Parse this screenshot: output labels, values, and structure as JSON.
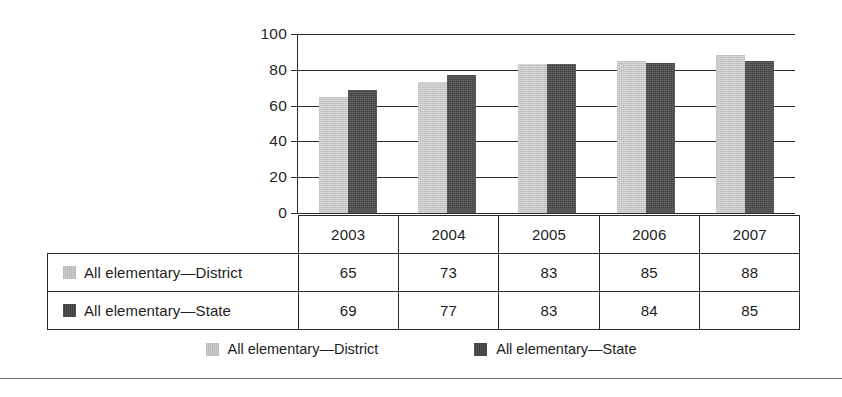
{
  "chart_data": {
    "type": "bar",
    "title": "",
    "xlabel": "",
    "ylabel": "",
    "ylim": [
      0,
      100
    ],
    "ytick_values": [
      0,
      20,
      40,
      60,
      80,
      100
    ],
    "ytick_labels": [
      "0",
      "20",
      "40",
      "60",
      "80",
      "100"
    ],
    "grid": true,
    "legend_position": "bottom",
    "categories": [
      "2003",
      "2004",
      "2005",
      "2006",
      "2007"
    ],
    "series": [
      {
        "name": "All elementary—District",
        "color": "#c9c9c9",
        "values": [
          65,
          73,
          83,
          85,
          88
        ]
      },
      {
        "name": "All elementary—State",
        "color": "#444444",
        "values": [
          69,
          77,
          83,
          84,
          85
        ]
      }
    ]
  },
  "table": {
    "header": [
      "",
      "2003",
      "2004",
      "2005",
      "2006",
      "2007"
    ],
    "rows": [
      {
        "label": "All elementary—District",
        "swatch": "district",
        "values": [
          "65",
          "73",
          "83",
          "85",
          "88"
        ]
      },
      {
        "label": "All elementary—State",
        "swatch": "state",
        "values": [
          "69",
          "77",
          "83",
          "84",
          "85"
        ]
      }
    ]
  },
  "legend": {
    "items": [
      {
        "label": "All elementary—District",
        "color": "#c9c9c9"
      },
      {
        "label": "All elementary—State",
        "color": "#444444"
      }
    ]
  }
}
